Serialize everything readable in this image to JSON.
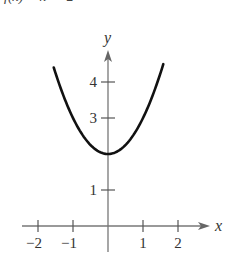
{
  "caption_clipped": "f(x) = x² + 2",
  "chart_data": {
    "type": "line",
    "title": "",
    "function": "f(x) = x^2 + 2",
    "xlabel": "x",
    "ylabel": "y",
    "xlim": [
      -2.5,
      2.9
    ],
    "ylim": [
      -0.7,
      5.2
    ],
    "x_ticks": [
      -2,
      -1,
      1,
      2
    ],
    "x_tick_labels": [
      "−2",
      "−1",
      "1",
      "2"
    ],
    "y_ticks": [
      1,
      3,
      4
    ],
    "y_tick_labels": [
      "1",
      "3",
      "4"
    ],
    "grid": false,
    "legend": null,
    "series": [
      {
        "name": "f(x) = x^2 + 2",
        "x": [
          -1.55,
          -1.5,
          -1.25,
          -1.0,
          -0.75,
          -0.5,
          -0.25,
          0,
          0.25,
          0.5,
          0.75,
          1.0,
          1.25,
          1.5,
          1.58
        ],
        "y": [
          4.4,
          4.25,
          3.5625,
          3.0,
          2.5625,
          2.25,
          2.0625,
          2.0,
          2.0625,
          2.25,
          2.5625,
          3.0,
          3.5625,
          4.25,
          4.5
        ]
      }
    ],
    "key_points": [
      {
        "x": 0,
        "y": 2,
        "note": "vertex / minimum"
      }
    ]
  },
  "layout": {
    "origin_px": [
      108,
      226
    ],
    "unit_px_x": 35,
    "unit_px_y": 36,
    "x_axis_start_px": 22,
    "x_axis_end_px": 210,
    "y_axis_top_px": 50,
    "y_axis_bottom_px": 252
  }
}
